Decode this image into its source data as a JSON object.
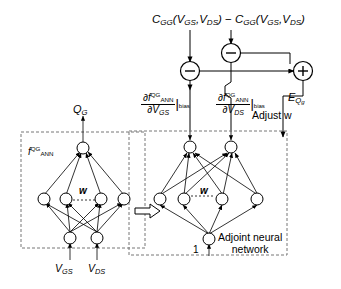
{
  "figure": {
    "title_formula": {
      "left_term": "C",
      "left_sub": "GG",
      "left_args": "(V",
      "left_arg1_sub": "GS",
      "left_mid": ",V",
      "left_arg2_sub": "DS",
      "left_close": ")",
      "operator": "−",
      "right_term": "C",
      "right_sub": "GG",
      "right_args": "(V",
      "right_arg1_sub": "GS",
      "right_mid": ",V",
      "right_arg2_sub": "DS",
      "right_close": ")",
      "full_text": "CGG(VGS,VDS) − CGG(VGS,VDS)"
    },
    "operators": [
      {
        "id": "minus-left",
        "symbol": "−",
        "cx": 190,
        "cy": 71
      },
      {
        "id": "minus-top",
        "symbol": "−",
        "cx": 231,
        "cy": 53
      },
      {
        "id": "plus-right",
        "symbol": "+",
        "cx": 303,
        "cy": 71
      }
    ],
    "derivative_left": {
      "numerator_f": "∂f",
      "numerator_sup": "QG",
      "numerator_sub": "ANN",
      "denominator_d": "∂V",
      "denominator_sub": "GS",
      "evaluated_at": "bias",
      "full_text": "∂f QG ANN / ∂V GS |bias"
    },
    "derivative_right": {
      "numerator_f": "∂f",
      "numerator_sup": "QG",
      "numerator_sub": "ANN",
      "denominator_d": "∂V",
      "denominator_sub": "DS",
      "evaluated_at": "bias",
      "full_text": "∂f QG ANN / ∂V DS |bias"
    },
    "error_label": {
      "symbol": "E",
      "subscript": "Q",
      "subsubscript": "g",
      "full_text": "EQg"
    },
    "adjust_label": "Adjust w",
    "forward_network": {
      "name_f": "f",
      "name_sup": "QG",
      "name_sub": "ANN",
      "weights_label": "w",
      "output_label": "Q",
      "output_sub": "G",
      "input_1": "V",
      "input_1_sub": "GS",
      "input_2": "V",
      "input_2_sub": "DS",
      "layers": {
        "output": 1,
        "hidden": 4,
        "input": 2
      }
    },
    "adjoint_network": {
      "caption_line1": "Adjoint neural",
      "caption_line2": "network",
      "weights_label": "w",
      "bias_input_label": "1",
      "layers": {
        "top": 2,
        "hidden": 4,
        "bottom": 1
      }
    },
    "transfer_arrow": "transfer-arrow-right",
    "colors": {
      "line": "#000000",
      "background": "#ffffff",
      "dashed_box": "#808080"
    }
  }
}
